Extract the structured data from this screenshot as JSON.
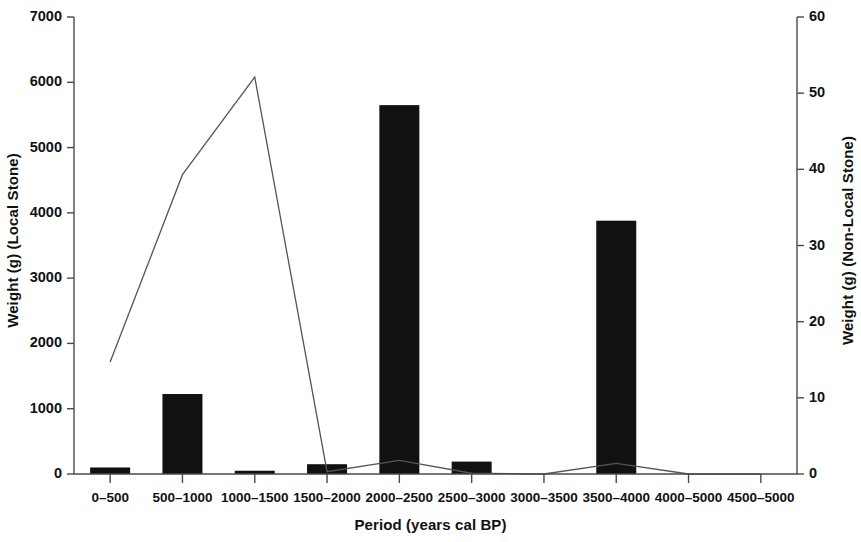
{
  "chart_data": {
    "type": "bar",
    "title": "",
    "subtitle": "",
    "xlabel": "Period (years cal BP)",
    "ylabel": "Weight (g) (Local Stone)",
    "ylabel_right": "Weight (g) (Non-Local Stone)",
    "categories": [
      "0–500",
      "500–1000",
      "1000–1500",
      "1500–2000",
      "2000–2500",
      "2500–3000",
      "3000–3500",
      "3500–4000",
      "4000–5000",
      "4500–5000"
    ],
    "ylim": [
      0,
      7000
    ],
    "ylim_right": [
      0,
      60
    ],
    "yticks": [
      "0",
      "1000",
      "2000",
      "3000",
      "4000",
      "5000",
      "6000",
      "7000"
    ],
    "ytick_values": [
      0,
      1000,
      2000,
      3000,
      4000,
      5000,
      6000,
      7000
    ],
    "yticks_right": [
      "0",
      "10",
      "20",
      "30",
      "40",
      "50",
      "60"
    ],
    "ytick_values_right": [
      0,
      10,
      20,
      30,
      40,
      50,
      60
    ],
    "grid": false,
    "legend": "none",
    "series": [
      {
        "name": "Weight (g) (Local Stone)",
        "type": "bar",
        "axis": "left",
        "color": "#111111",
        "values": [
          100,
          1225,
          50,
          150,
          5650,
          190,
          0,
          3880,
          0,
          0
        ]
      },
      {
        "name": "Weight (g) (Non-Local Stone)",
        "type": "line",
        "axis": "right",
        "color": "#555555",
        "values": [
          14.7,
          39.3,
          52.1,
          0.3,
          1.8,
          0.1,
          0.0,
          1.4,
          0.0,
          0.0
        ]
      }
    ]
  },
  "axis": {
    "left_title": "Weight (g) (Local Stone)",
    "right_title": "Weight (g) (Non-Local Stone)",
    "x_title": "Period (years cal BP)"
  }
}
